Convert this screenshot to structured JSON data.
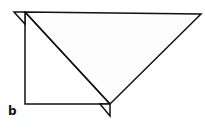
{
  "figure": {
    "panel_label": "b",
    "stroke_color": "#111111",
    "fill_color": "#ffffff"
  }
}
